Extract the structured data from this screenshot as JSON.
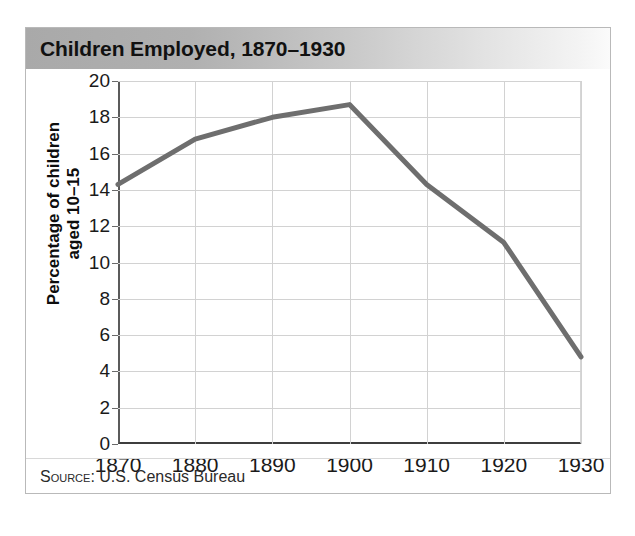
{
  "card": {
    "title": "Children Employed, 1870–1930",
    "source_prefix": "Source:",
    "source_text": " U.S. Census Bureau"
  },
  "colors": {
    "line": "#6e6e6e",
    "grid": "#d2d2d2",
    "axis": "#3d3d3d",
    "header_left": "#a9a9a9",
    "header_right": "#fbfbfb",
    "text": "#111111"
  },
  "axis": {
    "y_title_line1": "Percentage of children",
    "y_title_line2": "aged 10–15"
  },
  "chart_data": {
    "type": "line",
    "title": "Children Employed, 1870–1930",
    "xlabel": "",
    "ylabel": "Percentage of children aged 10–15",
    "x": [
      1870,
      1880,
      1890,
      1900,
      1910,
      1920,
      1930
    ],
    "xtick_labels": [
      "1870",
      "1880",
      "1890",
      "1900",
      "1910",
      "1920",
      "1930"
    ],
    "values": [
      14.3,
      16.8,
      18.0,
      18.7,
      14.3,
      11.1,
      4.8
    ],
    "ytick_labels": [
      "0",
      "2",
      "4",
      "6",
      "8",
      "10",
      "12",
      "14",
      "16",
      "18",
      "20"
    ],
    "yticks": [
      0,
      2,
      4,
      6,
      8,
      10,
      12,
      14,
      16,
      18,
      20
    ],
    "xlim": [
      1870,
      1930
    ],
    "ylim": [
      0,
      20
    ],
    "grid": true,
    "legend": false,
    "source": "Source: U.S. Census Bureau"
  }
}
